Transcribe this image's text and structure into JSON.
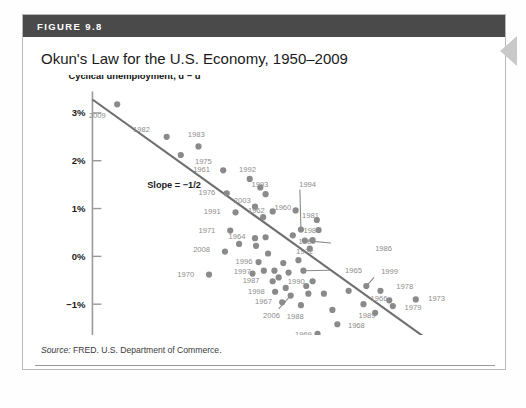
{
  "figure": {
    "header_label": "FIGURE 9.8",
    "title": "Okun's Law for the U.S. Economy, 1950–2009",
    "source_prefix": "Source:",
    "source_text": " FRED. U.S. Department of Commerce."
  },
  "colors": {
    "header_bar": "#4a4a4a",
    "dot": "#8a8a8a",
    "point_label": "#8d8d8d",
    "trendline": "#6f6f6f",
    "axis": "#9a9a9a",
    "arrow": "#c9c9c9"
  },
  "chart_data": {
    "type": "scatter",
    "title": "Okun's Law for the U.S. Economy, 1950–2009",
    "xlabel": "Short-run output, Ȳ",
    "ylabel": "Cyclical unemployment, u − ū",
    "xlim": [
      -7.0,
      4.8
    ],
    "ylim": [
      -2.0,
      3.5
    ],
    "grid": false,
    "legend": "none",
    "xticks": [
      "−6%",
      "−4%",
      "−2%",
      "0%",
      "+2%",
      "+4%"
    ],
    "xtick_values": [
      -6,
      -4,
      -2,
      0,
      2,
      4
    ],
    "yticks": [
      "3%",
      "2%",
      "1%",
      "0%",
      "−1%",
      "−2%"
    ],
    "ytick_values": [
      3,
      2,
      1,
      0,
      -1,
      -2
    ],
    "annotations": [
      {
        "text": "Slope = −1/2",
        "x": -4.9,
        "y": 1.42
      }
    ],
    "trendline": {
      "slope": -0.5,
      "x0": -6.45,
      "y0": 3.28,
      "x1": 3.4,
      "y1": -1.93
    },
    "points": [
      {
        "year": "2009",
        "x": -5.75,
        "y": 3.18,
        "lx": -6.55,
        "ly": 2.96,
        "lead": false
      },
      {
        "year": "1982",
        "x": -4.35,
        "y": 2.5,
        "lx": -5.3,
        "ly": 2.66,
        "lead": false
      },
      {
        "year": "1983",
        "x": -3.45,
        "y": 2.3,
        "lx": -3.75,
        "ly": 2.56,
        "lead": false
      },
      {
        "year": "1975",
        "x": -3.95,
        "y": 2.12,
        "lx": -3.55,
        "ly": 2.0,
        "lead": false
      },
      {
        "year": "1961",
        "x": -2.75,
        "y": 1.8,
        "lx": -3.6,
        "ly": 1.82,
        "lead": false
      },
      {
        "year": "1992",
        "x": -2.0,
        "y": 1.62,
        "lx": -2.3,
        "ly": 1.82,
        "lead": false
      },
      {
        "year": "1976",
        "x": -2.65,
        "y": 1.32,
        "lx": -3.45,
        "ly": 1.34,
        "lead": false
      },
      {
        "year": "1993",
        "x": -1.55,
        "y": 1.3,
        "lx": -1.95,
        "ly": 1.52,
        "lead": false
      },
      {
        "year": "2003",
        "x": -1.85,
        "y": 1.04,
        "lx": -2.45,
        "ly": 1.18,
        "lead": false
      },
      {
        "year": "1991",
        "x": -2.4,
        "y": 0.92,
        "lx": -3.3,
        "ly": 0.95,
        "lead": false
      },
      {
        "year": "1962",
        "x": -1.35,
        "y": 0.94,
        "lx": -2.05,
        "ly": 0.98,
        "lead": false
      },
      {
        "year": "1960",
        "x": -0.7,
        "y": 0.96,
        "lx": -1.3,
        "ly": 1.04,
        "lead": false
      },
      {
        "year": "1981",
        "x": -0.1,
        "y": 0.76,
        "lx": -0.52,
        "ly": 0.86,
        "lead": false
      },
      {
        "year": "1994",
        "x": -0.55,
        "y": 0.56,
        "lx": -0.6,
        "ly": 1.52,
        "lead": true,
        "leadx": -0.58,
        "leady": 1.4
      },
      {
        "year": "1971",
        "x": -2.55,
        "y": 0.54,
        "lx": -3.45,
        "ly": 0.56,
        "lead": false
      },
      {
        "year": "1984",
        "x": -0.05,
        "y": 0.55,
        "lx": -0.48,
        "ly": 0.55,
        "lead": false
      },
      {
        "year": "1964",
        "x": -1.85,
        "y": 0.38,
        "lx": -2.6,
        "ly": 0.42,
        "lead": false
      },
      {
        "year": "1985",
        "x": -0.22,
        "y": 0.34,
        "lx": -0.62,
        "ly": 0.32,
        "lead": false
      },
      {
        "year": "1972",
        "x": -0.3,
        "y": 0.16,
        "lx": -0.68,
        "ly": 0.12,
        "lead": false
      },
      {
        "year": "1986",
        "x": -0.44,
        "y": 0.33,
        "lx": 1.55,
        "ly": 0.18,
        "lead": true,
        "leadx": 0.3,
        "leady": 0.28
      },
      {
        "year": "2008",
        "x": -2.7,
        "y": 0.1,
        "lx": -3.6,
        "ly": 0.16,
        "lead": false
      },
      {
        "year": "1996",
        "x": -1.75,
        "y": -0.12,
        "lx": -2.4,
        "ly": -0.1,
        "lead": false
      },
      {
        "year": "1997",
        "x": -1.6,
        "y": -0.3,
        "lx": -2.45,
        "ly": -0.3,
        "lead": false
      },
      {
        "year": "1970",
        "x": -3.15,
        "y": -0.38,
        "lx": -4.05,
        "ly": -0.36,
        "lead": false
      },
      {
        "year": "1965",
        "x": -0.48,
        "y": -0.3,
        "lx": 0.7,
        "ly": -0.28,
        "lead": true,
        "leadx": 0.28,
        "leady": -0.29
      },
      {
        "year": "1987",
        "x": -1.35,
        "y": -0.52,
        "lx": -2.2,
        "ly": -0.5,
        "lead": false
      },
      {
        "year": "1990",
        "x": -0.22,
        "y": -0.52,
        "lx": -0.92,
        "ly": -0.52,
        "lead": false
      },
      {
        "year": "1999",
        "x": 1.3,
        "y": -0.62,
        "lx": 1.72,
        "ly": -0.3,
        "lead": true,
        "leadx": 1.52,
        "leady": -0.44
      },
      {
        "year": "1998",
        "x": -1.28,
        "y": -0.74,
        "lx": -2.05,
        "ly": -0.72,
        "lead": false
      },
      {
        "year": "1978",
        "x": 1.7,
        "y": -0.72,
        "lx": 2.15,
        "ly": -0.62,
        "lead": false
      },
      {
        "year": "1967",
        "x": -1.08,
        "y": -0.96,
        "lx": -1.85,
        "ly": -0.94,
        "lead": false
      },
      {
        "year": "2006",
        "x": -0.84,
        "y": -0.82,
        "lx": -1.62,
        "ly": -1.22,
        "lead": true,
        "leadx": -1.18,
        "leady": -1.1
      },
      {
        "year": "1988",
        "x": -0.55,
        "y": -1.02,
        "lx": -0.95,
        "ly": -1.24,
        "lead": false
      },
      {
        "year": "1966",
        "x": 1.95,
        "y": -0.92,
        "lx": 1.42,
        "ly": -0.88,
        "lead": false
      },
      {
        "year": "1973",
        "x": 2.7,
        "y": -0.9,
        "lx": 3.05,
        "ly": -0.88,
        "lead": false
      },
      {
        "year": "1979",
        "x": 2.05,
        "y": -1.04,
        "lx": 2.38,
        "ly": -1.06,
        "lead": false
      },
      {
        "year": "1989",
        "x": 1.55,
        "y": -1.18,
        "lx": 1.08,
        "ly": -1.22,
        "lead": false
      },
      {
        "year": "1968",
        "x": 0.48,
        "y": -1.42,
        "lx": 0.78,
        "ly": -1.44,
        "lead": false
      },
      {
        "year": "1969",
        "x": -0.08,
        "y": -1.62,
        "lx": -0.72,
        "ly": -1.62,
        "lead": false
      },
      {
        "year": "c1",
        "x": -1.62,
        "y": 0.82,
        "lx": null,
        "ly": null,
        "lead": false
      },
      {
        "year": "c2",
        "x": -1.55,
        "y": 0.4,
        "lx": null,
        "ly": null,
        "lead": false
      },
      {
        "year": "c3",
        "x": -1.48,
        "y": 0.06,
        "lx": null,
        "ly": null,
        "lead": false
      },
      {
        "year": "c4",
        "x": -1.82,
        "y": 0.22,
        "lx": null,
        "ly": null,
        "lead": false
      },
      {
        "year": "c5",
        "x": -1.3,
        "y": -0.3,
        "lx": null,
        "ly": null,
        "lead": false
      },
      {
        "year": "c6",
        "x": -1.18,
        "y": -0.44,
        "lx": null,
        "ly": null,
        "lead": false
      },
      {
        "year": "c7",
        "x": -1.05,
        "y": -0.14,
        "lx": null,
        "ly": null,
        "lead": false
      },
      {
        "year": "c8",
        "x": -0.9,
        "y": -0.34,
        "lx": null,
        "ly": null,
        "lead": false
      },
      {
        "year": "c9",
        "x": -0.78,
        "y": 0.44,
        "lx": null,
        "ly": null,
        "lead": false
      },
      {
        "year": "c10",
        "x": -0.62,
        "y": -0.08,
        "lx": null,
        "ly": null,
        "lead": false
      },
      {
        "year": "c11",
        "x": -0.4,
        "y": -0.62,
        "lx": null,
        "ly": null,
        "lead": false
      },
      {
        "year": "c12",
        "x": -0.34,
        "y": -0.78,
        "lx": null,
        "ly": null,
        "lead": false
      },
      {
        "year": "c13",
        "x": 0.1,
        "y": -0.78,
        "lx": null,
        "ly": null,
        "lead": false
      },
      {
        "year": "c14",
        "x": 0.34,
        "y": -1.12,
        "lx": null,
        "ly": null,
        "lead": false
      },
      {
        "year": "c15",
        "x": 0.8,
        "y": -0.72,
        "lx": null,
        "ly": null,
        "lead": false
      },
      {
        "year": "c16",
        "x": 1.22,
        "y": -1.0,
        "lx": null,
        "ly": null,
        "lead": false
      },
      {
        "year": "c17",
        "x": -2.3,
        "y": 0.26,
        "lx": null,
        "ly": null,
        "lead": false
      },
      {
        "year": "c18",
        "x": -1.92,
        "y": -0.36,
        "lx": null,
        "ly": null,
        "lead": false
      },
      {
        "year": "c19",
        "x": -0.98,
        "y": -0.66,
        "lx": null,
        "ly": null,
        "lead": false
      },
      {
        "year": "c20",
        "x": -1.7,
        "y": 1.44,
        "lx": null,
        "ly": null,
        "lead": false
      }
    ]
  }
}
